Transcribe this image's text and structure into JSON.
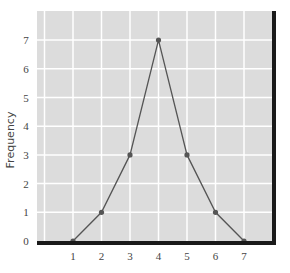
{
  "chart_data": {
    "type": "line",
    "title": "",
    "xlabel": "",
    "ylabel": "Frequency",
    "x": [
      1,
      2,
      3,
      4,
      5,
      6,
      7
    ],
    "values": [
      0,
      1,
      3,
      7,
      3,
      1,
      0
    ],
    "series": [
      {
        "name": "Frequency",
        "x": [
          1,
          2,
          3,
          4,
          5,
          6,
          7
        ],
        "values": [
          0,
          1,
          3,
          7,
          3,
          1,
          0
        ]
      }
    ],
    "x_ticks": [
      "1",
      "2",
      "3",
      "4",
      "5",
      "6",
      "7"
    ],
    "y_ticks": [
      "0",
      "1",
      "2",
      "3",
      "4",
      "5",
      "6",
      "7"
    ],
    "xlim": [
      0,
      8
    ],
    "ylim": [
      0,
      8
    ],
    "grid": true,
    "legend": "none"
  },
  "colors": {
    "plot_background": "#dcdcdc",
    "grid": "#ffffff",
    "line": "#555555",
    "marker": "#555555",
    "axis_frame": "#1a1a1a",
    "tick_text": "#444444"
  }
}
